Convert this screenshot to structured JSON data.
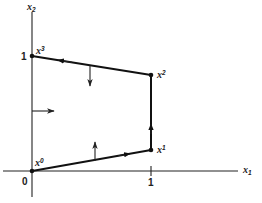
{
  "axes": {
    "x_label": "x",
    "x_subscript": "1",
    "y_label": "x",
    "y_subscript": "2",
    "origin_label": "0",
    "x_tick_label": "1",
    "y_tick_label": "1"
  },
  "points": [
    {
      "id": "x0",
      "base": "x",
      "sup": "0",
      "coord": [
        0,
        0
      ]
    },
    {
      "id": "x1",
      "base": "x",
      "sup": "1",
      "coord": [
        1,
        0.18
      ]
    },
    {
      "id": "x2",
      "base": "x",
      "sup": "2",
      "coord": [
        1,
        0.83
      ]
    },
    {
      "id": "x3",
      "base": "x",
      "sup": "3",
      "coord": [
        0,
        1
      ]
    }
  ],
  "path": {
    "order": [
      "x0",
      "x1",
      "x2",
      "x3"
    ],
    "direction_arrows": [
      "x0->x1 right",
      "x1->x2 up",
      "x2->x3 left"
    ]
  },
  "normal_arrows": [
    {
      "edge": "x2-x3",
      "direction": "down"
    },
    {
      "edge": "x3-x0 (x2 axis)",
      "direction": "right"
    },
    {
      "edge": "x0-x1",
      "direction": "up"
    }
  ],
  "colors": {
    "ink": "#111111",
    "background": "#ffffff"
  }
}
